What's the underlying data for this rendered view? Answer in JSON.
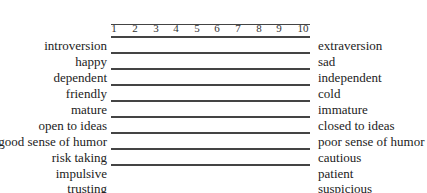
{
  "document": {
    "cropped_header_note": "",
    "scale": {
      "ticks": [
        "1",
        "2",
        "3",
        "4",
        "5",
        "6",
        "7",
        "8",
        "9",
        "10"
      ]
    },
    "pairs": [
      {
        "left": "introversion",
        "right": "extraversion",
        "has_line": true
      },
      {
        "left": "happy",
        "right": "sad",
        "has_line": true
      },
      {
        "left": "dependent",
        "right": "independent",
        "has_line": true
      },
      {
        "left": "friendly",
        "right": "cold",
        "has_line": true
      },
      {
        "left": "mature",
        "right": "immature",
        "has_line": true
      },
      {
        "left": "open to ideas",
        "right": "closed to ideas",
        "has_line": true
      },
      {
        "left": "good sense of humor",
        "right": "poor sense of humor",
        "has_line": true
      },
      {
        "left": "risk taking",
        "right": "cautious",
        "has_line": true
      },
      {
        "left": "impulsive",
        "right": "patient",
        "has_line": true
      },
      {
        "left": "trusting",
        "right": "suspicious",
        "has_line": false
      }
    ],
    "colors": {
      "text": "#222222",
      "line": "#444444",
      "background": "#ffffff"
    }
  }
}
